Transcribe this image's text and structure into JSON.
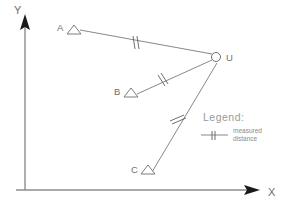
{
  "axes": {
    "y_label": "Y",
    "x_label": "X",
    "y_icon": "arrow-up-icon",
    "x_icon": "arrow-right-icon"
  },
  "stations": [
    {
      "id": "A",
      "label": "A",
      "marker": "triangle-marker",
      "x": 74,
      "y": 33
    },
    {
      "id": "B",
      "label": "B",
      "marker": "triangle-marker",
      "x": 131,
      "y": 96
    },
    {
      "id": "C",
      "label": "C",
      "marker": "triangle-marker",
      "x": 148,
      "y": 179
    },
    {
      "id": "U",
      "label": "U",
      "marker": "circle-marker",
      "x": 216,
      "y": 57
    }
  ],
  "rays": [
    {
      "id": "A-U",
      "from": "A",
      "to": "U",
      "tick_count": 2,
      "tick_x": 135,
      "tick_y": 43
    },
    {
      "id": "B-U",
      "from": "B",
      "to": "U",
      "tick_count": 2,
      "tick_x": 162,
      "tick_y": 80
    },
    {
      "id": "C-U",
      "from": "C",
      "to": "U",
      "tick_count": 2,
      "tick_x": 177,
      "tick_y": 118
    }
  ],
  "legend": {
    "title": "Legend:",
    "entry_line1": "measured",
    "entry_line2": "distance",
    "symbol": "double-tick-line-icon"
  },
  "colors": {
    "axis": "#8d8d8d",
    "ray": "#7a7a7a",
    "text": "#6e6e6e",
    "legend_title": "#9a9a9a",
    "background": "#ffffff"
  }
}
